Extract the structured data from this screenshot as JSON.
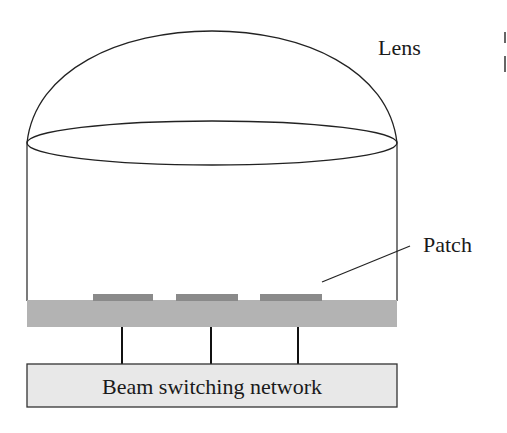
{
  "diagram": {
    "labels": {
      "lens": "Lens",
      "patch": "Patch",
      "network": "Beam switching network"
    },
    "components": {
      "lens": {
        "shape": "hemispherical dome over cylinder",
        "stroke": "#222222"
      },
      "substrate": {
        "fill": "#b3b3b3"
      },
      "patches": [
        {
          "id": "patch-1",
          "fill": "#8a8a8a"
        },
        {
          "id": "patch-2",
          "fill": "#8a8a8a"
        },
        {
          "id": "patch-3",
          "fill": "#8a8a8a"
        }
      ],
      "feed_lines": 3,
      "network_box": {
        "fill": "#e8e8e8",
        "stroke": "#333333"
      }
    }
  }
}
